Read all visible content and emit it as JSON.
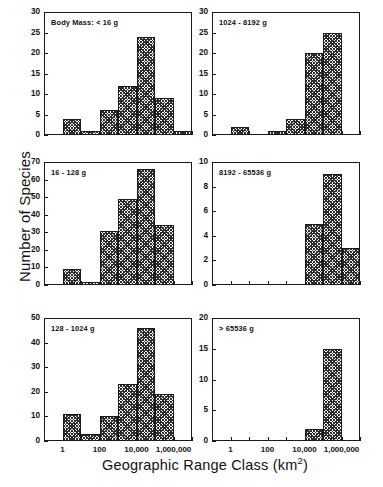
{
  "chart_data": {
    "type": "bar",
    "title": "",
    "xlabel": "Geographic Range Class (km2)",
    "xlabel_base": "Geographic Range Class (km",
    "xlabel_sup": "2",
    "xlabel_tail": ")",
    "ylabel": "Number of Species",
    "xscale": "log",
    "grid": false,
    "legend": "none",
    "xtick_labels": [
      "1",
      "100",
      "10,000",
      "1,000,000"
    ],
    "xtick_values": [
      1,
      100,
      10000,
      1000000
    ],
    "bin_edges_log10": [
      -1,
      0,
      1,
      2,
      3,
      4,
      5,
      6,
      7
    ],
    "categories": [
      "0.1-1",
      "1-10",
      "10-100",
      "100-1,000",
      "1,000-10,000",
      "10,000-100,000",
      "100,000-1,000,000",
      "1,000,000-10,000,000"
    ],
    "panels": [
      {
        "key": "lt16",
        "label": "Body Mass: < 16 g",
        "ylim": [
          0,
          30
        ],
        "ytick_step": 5,
        "yticks": [
          0,
          5,
          10,
          15,
          20,
          25,
          30
        ],
        "values": [
          0,
          4,
          1,
          6,
          12,
          24,
          9,
          1
        ]
      },
      {
        "key": "1024-8192",
        "label": "1024 - 8192 g",
        "ylim": [
          0,
          30
        ],
        "ytick_step": 5,
        "yticks": [
          0,
          5,
          10,
          15,
          20,
          25,
          30
        ],
        "values": [
          0,
          2,
          0,
          1,
          4,
          20,
          25,
          0
        ]
      },
      {
        "key": "16-128",
        "label": "16 - 128 g",
        "ylim": [
          0,
          70
        ],
        "ytick_step": 10,
        "yticks": [
          0,
          10,
          20,
          30,
          40,
          50,
          60,
          70
        ],
        "values": [
          0,
          9,
          2,
          31,
          49,
          66,
          34,
          0
        ]
      },
      {
        "key": "8192-65536",
        "label": "8192 - 65536 g",
        "ylim": [
          0,
          10
        ],
        "ytick_step": 2,
        "yticks": [
          0,
          2,
          4,
          6,
          8,
          10
        ],
        "values": [
          0,
          0,
          0,
          0,
          0,
          5,
          9,
          3
        ]
      },
      {
        "key": "128-1024",
        "label": "128 - 1024 g",
        "ylim": [
          0,
          50
        ],
        "ytick_step": 10,
        "yticks": [
          0,
          10,
          20,
          30,
          40,
          50
        ],
        "values": [
          0,
          11,
          3,
          10,
          23,
          46,
          19,
          0
        ]
      },
      {
        "key": "gt65536",
        "label": "> 65536 g",
        "ylim": [
          0,
          20
        ],
        "ytick_step": 5,
        "yticks": [
          0,
          5,
          10,
          15,
          20
        ],
        "values": [
          0,
          0,
          0,
          0,
          0,
          2,
          15,
          0
        ]
      }
    ],
    "colors": {
      "axis": "#1a1a1a",
      "bar_hatch": "#2b2b2b",
      "bar_face": "#ffffff",
      "background": "#ffffff"
    }
  },
  "layout": {
    "panel_width": 148,
    "panel_height": 123,
    "col_x": [
      44,
      212
    ],
    "row_y": [
      12,
      162,
      318
    ],
    "xaxis_rows": [
      2
    ]
  }
}
